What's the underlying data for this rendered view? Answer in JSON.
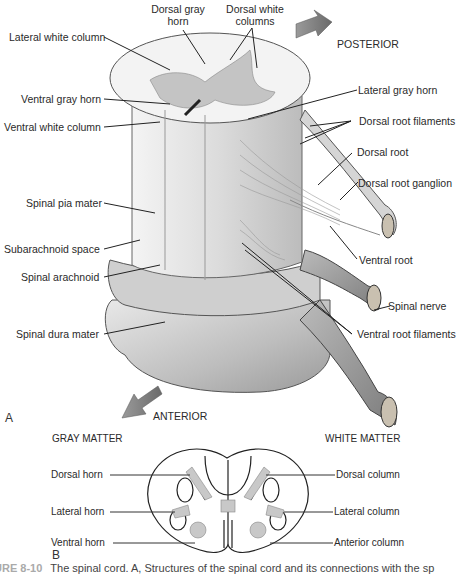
{
  "panel_a": {
    "letter": "A",
    "direction_posterior": "POSTERIOR",
    "direction_anterior": "ANTERIOR",
    "labels_left": [
      {
        "text": "Lateral white column"
      },
      {
        "text": "Ventral gray horn"
      },
      {
        "text": "Ventral white column"
      },
      {
        "text": "Spinal pia mater"
      },
      {
        "text": "Subarachnoid space"
      },
      {
        "text": "Spinal arachnoid"
      },
      {
        "text": "Spinal dura mater"
      }
    ],
    "labels_top": [
      {
        "line1": "Dorsal gray",
        "line2": "horn"
      },
      {
        "line1": "Dorsal white",
        "line2": "columns"
      }
    ],
    "labels_right": [
      {
        "text": "Lateral gray horn"
      },
      {
        "text": "Dorsal root filaments"
      },
      {
        "text": "Dorsal root"
      },
      {
        "text": "Dorsal root ganglion"
      },
      {
        "text": "Ventral root"
      },
      {
        "text": "Spinal nerve"
      },
      {
        "text": "Ventral root filaments"
      }
    ]
  },
  "panel_b": {
    "letter": "B",
    "gray_matter_heading": "GRAY MATTER",
    "white_matter_heading": "WHITE MATTER",
    "gray_labels": [
      "Dorsal horn",
      "Lateral horn",
      "Ventral horn"
    ],
    "white_labels": [
      "Dorsal column",
      "Lateral column",
      "Anterior column"
    ]
  },
  "caption": {
    "figure": "URE 8-10",
    "text": "The spinal cord. A, Structures of the spinal cord and its connections with the sp"
  }
}
